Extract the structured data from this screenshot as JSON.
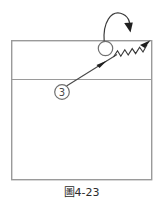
{
  "figure": {
    "caption": "圖4-23",
    "caption_number": "4-23",
    "caption_prefix": "圖",
    "background_color": "#ffffff",
    "line_color": "#8a8a8a",
    "ink_color": "#3a3a3a"
  },
  "court": {
    "name": "court-rectangle",
    "x": 11,
    "y": 40,
    "width": 141,
    "height": 140,
    "stroke": "#9a9a9a",
    "stroke_width": 1.4,
    "fill": "#ffffff",
    "attack_line": {
      "name": "attack-line",
      "x1": 11,
      "y1": 79.5,
      "x2": 152,
      "y2": 79.5,
      "stroke": "#9a9a9a",
      "stroke_width": 1.2
    }
  },
  "markers": [
    {
      "id": "player-3",
      "label": "3",
      "cx": 62,
      "cy": 92,
      "r": 7.2,
      "stroke": "#6f6f6f",
      "text_color": "#4a4a4a",
      "font_size": 9.5
    },
    {
      "id": "ball-circle",
      "label": "",
      "cx": 105.5,
      "cy": 48.5,
      "r": 7.2,
      "stroke": "#6f6f6f",
      "text_color": "#4a4a4a",
      "font_size": 9.5
    }
  ],
  "paths": {
    "approach_line": {
      "name": "approach-straight-arrow",
      "d": "M 65.5 86.5 L 116.5 55.0",
      "stroke": "#4a4a4a",
      "stroke_width": 1.2,
      "arrow_at": "midpoint",
      "arrow_x": 104,
      "arrow_y": 62.2,
      "arrow_angle_deg": -31.7
    },
    "spike_zigzag": {
      "name": "spike-zigzag-arrow",
      "d": "M 113.0 57.5 L 117.0 51.0 L 120.5 56.0 L 124.5 49.5 L 128.0 54.5 L 132.0 48.0 L 135.5 53.0 L 139.5 46.5 L 143.0 51.5 L 147.5 44.0",
      "stroke": "#4a4a4a",
      "stroke_width": 1.2,
      "arrow_x": 149.5,
      "arrow_y": 41.0,
      "arrow_angle_deg": -58.0
    },
    "toss_curve": {
      "name": "toss-curved-arrow",
      "d": "M 104.5 42.0 C 104.0 20.0 112.0 11.5 121.0 13.5 C 128.0 15.5 130.5 22.0 129.5 28.5",
      "stroke": "#4a4a4a",
      "stroke_width": 1.2,
      "arrow_x": 130.0,
      "arrow_y": 31.5,
      "arrow_angle_deg": 100.0
    }
  }
}
